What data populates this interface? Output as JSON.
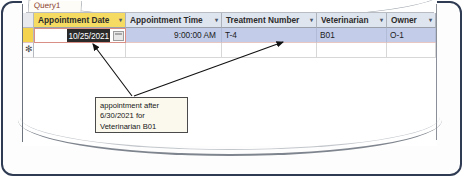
{
  "window": {
    "tab_label": "Query1"
  },
  "datasheet": {
    "columns": [
      {
        "label": "Appointment Date",
        "sorted": true,
        "caret": "▾"
      },
      {
        "label": "Appointment Time",
        "sorted": false,
        "caret": "▾"
      },
      {
        "label": "Treatment Number",
        "sorted": false,
        "caret": "▾"
      },
      {
        "label": "Veterinarian",
        "sorted": false,
        "caret": "▾"
      },
      {
        "label": "Owner",
        "sorted": false,
        "caret": "▾"
      }
    ],
    "rows": [
      {
        "appointment_date": "10/25/2021",
        "appointment_time": "9:00:00 AM",
        "treatment_number": "T-4",
        "veterinarian": "B01",
        "owner": "O-1"
      }
    ],
    "new_record_marker": "✻",
    "date_picker_icon": "calendar-icon"
  },
  "annotation": {
    "lines": [
      "appointment after",
      "6/30/2021 for",
      "Veterinarian B01"
    ]
  },
  "colors": {
    "sorted_header": "#f6db63",
    "header": "#dfe5ef",
    "selected_row": "#c3cdea",
    "record_selector_current": "#f4d44e",
    "frame": "#2f3b53",
    "callout_bg": "#fbf9ee"
  }
}
